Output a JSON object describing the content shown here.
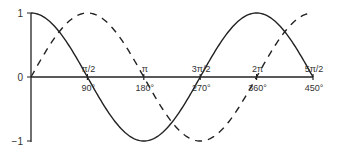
{
  "chart_data": {
    "type": "line",
    "title": "",
    "xlabel": "",
    "ylabel": "",
    "xlim": [
      0,
      450
    ],
    "ylim": [
      -1,
      1
    ],
    "grid": false,
    "legend": null,
    "y_ticks": [
      {
        "value": 1,
        "label": "1"
      },
      {
        "value": 0,
        "label": "0"
      },
      {
        "value": -1,
        "label": "−1"
      }
    ],
    "x_ticks_degrees": [
      {
        "value": 90,
        "label": "90°"
      },
      {
        "value": 180,
        "label": "180°"
      },
      {
        "value": 270,
        "label": "270°"
      },
      {
        "value": 360,
        "label": "360°"
      },
      {
        "value": 450,
        "label": "450°"
      }
    ],
    "x_ticks_radians": [
      {
        "value": 90,
        "label": "π/2"
      },
      {
        "value": 180,
        "label": "π"
      },
      {
        "value": 270,
        "label": "3π/2"
      },
      {
        "value": 360,
        "label": "2π"
      },
      {
        "value": 450,
        "label": "5π/2"
      }
    ],
    "x": [
      0,
      45,
      90,
      135,
      180,
      225,
      270,
      315,
      360,
      405,
      450
    ],
    "series": [
      {
        "name": "cos",
        "style": "solid",
        "values": [
          1,
          0.707,
          0,
          -0.707,
          -1,
          -0.707,
          0,
          0.707,
          1,
          0.707,
          0
        ]
      },
      {
        "name": "sin",
        "style": "dashed",
        "values": [
          0,
          0.707,
          1,
          0.707,
          0,
          -0.707,
          -1,
          -0.707,
          0,
          0.707,
          1
        ]
      }
    ]
  }
}
